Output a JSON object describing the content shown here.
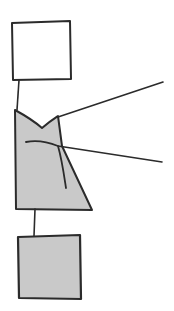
{
  "canvas": {
    "width": 174,
    "height": 311,
    "background_color": "#ffffff",
    "title": "Hand-drawn sketch diagram"
  },
  "style": {
    "stroke_color": "#2b2b2b",
    "fill_gray": "#c9c9c9",
    "fill_white": "#ffffff",
    "stroke_width_shape": 2.0,
    "stroke_width_line": 1.6
  },
  "shapes": [
    {
      "id": "head-square",
      "label": "Top square",
      "kind": "quadrilateral",
      "fill": "#ffffff",
      "stroke": "#2b2b2b",
      "points": "12,23 70,21 71,79 13,80"
    },
    {
      "id": "neck-line",
      "label": "Neck connector",
      "kind": "polyline",
      "stroke": "#2b2b2b",
      "points": "19,80 17,110"
    },
    {
      "id": "body-shape",
      "label": "Body polygon with curved notch",
      "kind": "path",
      "fill": "#c9c9c9",
      "stroke": "#2b2b2b",
      "path": "M15,110 C26,116 34,121 42,128 C50,121 55,118 58,116 L62,146 L92,210 L16,209 Z"
    },
    {
      "id": "beak-notch",
      "label": "Inner curved beak line",
      "kind": "path",
      "stroke": "#2b2b2b",
      "path": "M26,142 C36,140 48,142 58,146 C62,160 64,175 66,188"
    },
    {
      "id": "ray-upper",
      "label": "Upper radiating line",
      "kind": "polyline",
      "stroke": "#2b2b2b",
      "points": "58,117 163,82"
    },
    {
      "id": "ray-lower",
      "label": "Lower radiating line",
      "kind": "polyline",
      "stroke": "#2b2b2b",
      "points": "58,146 162,162"
    },
    {
      "id": "stem-line",
      "label": "Lower stem connector",
      "kind": "polyline",
      "stroke": "#2b2b2b",
      "points": "35,209 34,236"
    },
    {
      "id": "base-square",
      "label": "Bottom square",
      "kind": "quadrilateral",
      "fill": "#c9c9c9",
      "stroke": "#2b2b2b",
      "points": "18,237 80,235 81,299 19,298"
    }
  ]
}
